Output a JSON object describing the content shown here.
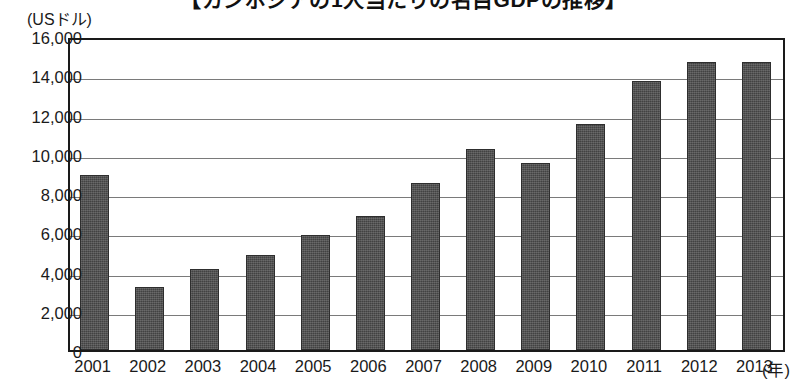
{
  "chart_data": {
    "type": "bar",
    "title": "【カンボジアの1人当たりの名目GDPの推移】",
    "subtitle": "",
    "xlabel": "(年)",
    "ylabel": "(USドル)",
    "categories": [
      "2001",
      "2002",
      "2003",
      "2004",
      "2005",
      "2006",
      "2007",
      "2008",
      "2009",
      "2010",
      "2011",
      "2012",
      "2013"
    ],
    "values": [
      8900,
      3200,
      4150,
      4850,
      5850,
      6850,
      8500,
      10250,
      9550,
      11500,
      13700,
      14700,
      14700
    ],
    "ylim": [
      0,
      16000
    ],
    "ytick_labels": [
      "16,000",
      "14,000",
      "12,000",
      "10,000",
      "8,000",
      "6,000",
      "4,000",
      "2,000",
      "0"
    ],
    "ytick_values": [
      16000,
      14000,
      12000,
      10000,
      8000,
      6000,
      4000,
      2000,
      0
    ],
    "grid": true,
    "legend": "none",
    "bar_color": "#4a4a4a",
    "axis_color": "#1a1a1a",
    "grid_color": "#7a7a7a",
    "background_color": "#ffffff",
    "series": [
      {
        "name": "1人当たり名目GDP",
        "values": [
          8900,
          3200,
          4150,
          4850,
          5850,
          6850,
          8500,
          10250,
          9550,
          11500,
          13700,
          14700,
          14700
        ]
      }
    ]
  }
}
